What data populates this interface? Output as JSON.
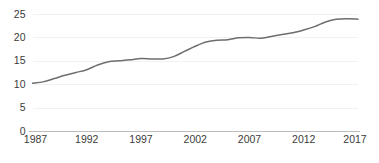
{
  "chart_data": {
    "type": "line",
    "title": "",
    "subtitle": "",
    "xlabel": "",
    "ylabel": "",
    "xlim": [
      1987,
      2017
    ],
    "ylim": [
      0,
      25
    ],
    "grid": true,
    "legend": false,
    "legend_position": "none",
    "line_color": "#6e6e6e",
    "axis_color": "#b5b5b5",
    "grid_color": "#ededed",
    "tick_text_color": "#3b3b3b",
    "y_ticks": [
      0,
      5,
      10,
      15,
      20,
      25
    ],
    "y_tick_labels": [
      "0",
      "5",
      "10",
      "15",
      "20",
      "25"
    ],
    "x_ticks": [
      1987,
      1992,
      1997,
      2002,
      2007,
      2012,
      2017
    ],
    "x_tick_labels": [
      "1987",
      "1992",
      "1997",
      "2002",
      "2007",
      "2012",
      "2017"
    ],
    "x": [
      1987,
      1988,
      1989,
      1990,
      1991,
      1992,
      1993,
      1994,
      1995,
      1996,
      1997,
      1998,
      1999,
      2000,
      2001,
      2002,
      2003,
      2004,
      2005,
      2006,
      2007,
      2008,
      2009,
      2010,
      2011,
      2012,
      2013,
      2014,
      2015,
      2016,
      2017
    ],
    "series": [
      {
        "name": "",
        "values": [
          10.2,
          10.5,
          11.2,
          11.9,
          12.5,
          13.1,
          14.1,
          14.8,
          15.0,
          15.2,
          15.5,
          15.4,
          15.4,
          15.9,
          17.0,
          18.1,
          19.0,
          19.4,
          19.5,
          19.9,
          20.0,
          19.8,
          20.2,
          20.6,
          21.0,
          21.6,
          22.3,
          23.3,
          23.9,
          24.0,
          23.9
        ]
      }
    ]
  }
}
